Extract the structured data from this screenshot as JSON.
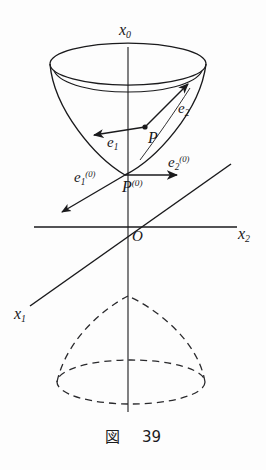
{
  "figure": {
    "caption_symbol": "図",
    "caption_number": "39",
    "stroke_color": "#1a1a1c",
    "background_color": "#fdfdfd"
  },
  "axes": {
    "vertical": {
      "label": "x",
      "sub": "0",
      "name": "x0-axis"
    },
    "horizontal_right": {
      "label": "x",
      "sub": "2",
      "name": "x2-axis"
    },
    "diagonal": {
      "label": "x",
      "sub": "1",
      "name": "x1-axis"
    },
    "origin": {
      "label": "O",
      "name": "origin"
    }
  },
  "points": {
    "p": {
      "label": "P",
      "name": "point-p"
    },
    "p0": {
      "label": "P",
      "sup": "(0)",
      "name": "point-p0"
    }
  },
  "vectors": {
    "e1": {
      "label": "e",
      "sub": "1",
      "name": "vector-e1"
    },
    "e2": {
      "label": "e",
      "sub": "2",
      "name": "vector-e2"
    },
    "e1_0": {
      "label": "e",
      "sub": "1",
      "sup": "(0)",
      "name": "vector-e1-0"
    },
    "e2_0": {
      "label": "e",
      "sub": "2",
      "sup": "(0)",
      "name": "vector-e2-0"
    }
  }
}
